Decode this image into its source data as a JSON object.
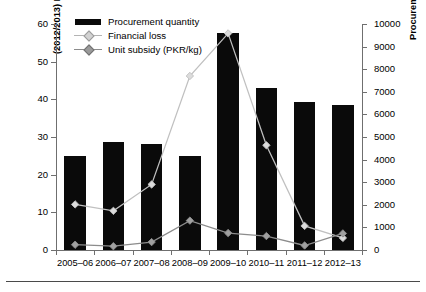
{
  "chart_data": {
    "type": "bar",
    "title": "",
    "categories": [
      "2005–06",
      "2006–07",
      "2007–08",
      "2008–09",
      "2009–10",
      "2010–11",
      "2011–12",
      "2012–13"
    ],
    "xlabel": "",
    "series": [
      {
        "name": "Procurement quantity",
        "render": "bar",
        "axis": "right",
        "unit": "thousands of metric tons",
        "color": "#0a0a0a",
        "values": [
          4150,
          4800,
          4700,
          4150,
          9600,
          7150,
          6550,
          6400
        ]
      },
      {
        "name": "Financial loss",
        "render": "line",
        "axis": "left",
        "unit": "PKR (billions)",
        "color": "#c0c0c0",
        "marker": "diamond",
        "values": [
          12.1,
          10.4,
          17.4,
          46.2,
          57.5,
          27.8,
          6.4,
          3.2
        ]
      },
      {
        "name": "Unit subsidy (PKR/kg)",
        "render": "line",
        "axis": "left",
        "unit": "PKR/kg",
        "color": "#8c8c8c",
        "marker": "diamond",
        "values": [
          1.4,
          1.0,
          2.1,
          7.8,
          4.5,
          3.7,
          1.2,
          4.4
        ]
      }
    ],
    "left_axis": {
      "label": "(2012/2013) PKR/kg and PKR (billions)",
      "ylim": [
        0,
        60
      ],
      "ticks": [
        0,
        10,
        20,
        30,
        40,
        50,
        60
      ],
      "ticklabels": [
        "0",
        "10",
        "20",
        "30",
        "40",
        "50",
        "60"
      ]
    },
    "right_axis": {
      "label": "Procurement (thousands of metric tons)",
      "ylim": [
        0,
        10000
      ],
      "ticks": [
        0,
        1000,
        2000,
        3000,
        4000,
        5000,
        6000,
        7000,
        8000,
        9000,
        10000
      ],
      "ticklabels": [
        "0",
        "1000",
        "2000",
        "3000",
        "4000",
        "5000",
        "6000",
        "7000",
        "8000",
        "9000",
        "10000"
      ]
    },
    "grid": false,
    "legend_position": "top-left"
  },
  "legend": {
    "items": [
      {
        "label": "Procurement quantity",
        "key": "bar-swatch"
      },
      {
        "label": "Financial loss",
        "key": "line-light"
      },
      {
        "label": "Unit subsidy (PKR/kg)",
        "key": "line-dark"
      }
    ]
  },
  "caption": {
    "text": ""
  }
}
